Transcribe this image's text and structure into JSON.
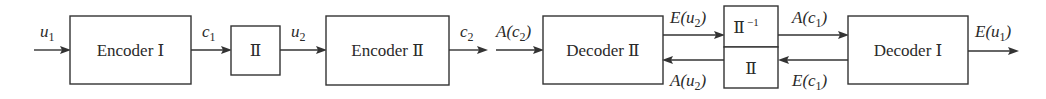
{
  "diagram": {
    "type": "turbo-code encoder/decoder block diagram",
    "blocks": {
      "encoder1": {
        "label": "Encoder Ⅰ"
      },
      "interleaver": {
        "label": "Ⅱ"
      },
      "encoder2": {
        "label": "Encoder Ⅱ"
      },
      "decoder2": {
        "label": "Decoder Ⅱ"
      },
      "deinterleaver": {
        "label": "Ⅱ",
        "sup": "−1"
      },
      "interleaver2": {
        "label": "Ⅱ"
      },
      "decoder1": {
        "label": "Decoder Ⅰ"
      }
    },
    "signals": {
      "u1": {
        "base": "u",
        "sub": "1"
      },
      "c1": {
        "base": "c",
        "sub": "1"
      },
      "u2": {
        "base": "u",
        "sub": "2"
      },
      "c2": {
        "base": "c",
        "sub": "2"
      },
      "Ac2": {
        "pre": "A(",
        "base": "c",
        "sub": "2",
        "post": ")"
      },
      "Eu2": {
        "pre": "E(",
        "base": "u",
        "sub": "2",
        "post": ")"
      },
      "Au2": {
        "pre": "A(",
        "base": "u",
        "sub": "2",
        "post": ")"
      },
      "Ac1": {
        "pre": "A(",
        "base": "c",
        "sub": "1",
        "post": ")"
      },
      "Ec1": {
        "pre": "E(",
        "base": "c",
        "sub": "1",
        "post": ")"
      },
      "Eu1": {
        "pre": "E(",
        "base": "u",
        "sub": "1",
        "post": ")"
      }
    },
    "colors": {
      "stroke": "#333333",
      "text": "#2a2a2a",
      "background": "#ffffff"
    }
  }
}
